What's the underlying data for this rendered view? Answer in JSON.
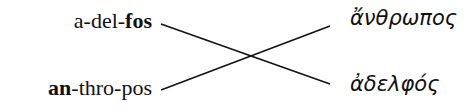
{
  "left_items": [
    {
      "parts": [
        {
          "text": "a-del-",
          "bold": false
        },
        {
          "text": "fos",
          "bold": true
        }
      ]
    },
    {
      "parts": [
        {
          "text": "an",
          "bold": true
        },
        {
          "text": "-thro-pos",
          "bold": false
        }
      ]
    }
  ],
  "right_items": [
    "ἄνθρωπος",
    "ἀδελφός"
  ],
  "lines": [
    {
      "from": "left_items.0",
      "to": "right_items.1"
    },
    {
      "from": "left_items.1",
      "to": "right_items.0"
    }
  ],
  "colors": {
    "text": "#111111",
    "line": "#111111",
    "background": "#ffffff"
  }
}
